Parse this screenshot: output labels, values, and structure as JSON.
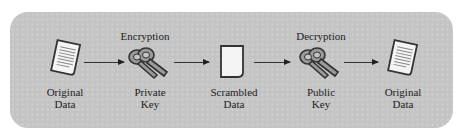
{
  "diagram": {
    "steps": [
      {
        "id": "original-data-1",
        "label_line1": "Original",
        "label_line2": "Data",
        "icon": "document-icon"
      },
      {
        "id": "private-key",
        "title": "Encryption",
        "label_line1": "Private",
        "label_line2": "Key",
        "icon": "keys-icon"
      },
      {
        "id": "scrambled-data",
        "label_line1": "Scrambled",
        "label_line2": "Data",
        "icon": "blank-document-icon"
      },
      {
        "id": "public-key",
        "title": "Decryption",
        "label_line1": "Public",
        "label_line2": "Key",
        "icon": "keys-icon"
      },
      {
        "id": "original-data-2",
        "label_line1": "Original",
        "label_line2": "Data",
        "icon": "document-icon"
      }
    ],
    "arrows": [
      {
        "from": "original-data-1",
        "to": "private-key"
      },
      {
        "from": "private-key",
        "to": "scrambled-data"
      },
      {
        "from": "scrambled-data",
        "to": "public-key"
      },
      {
        "from": "public-key",
        "to": "original-data-2"
      }
    ],
    "colors": {
      "panel": "#c4c4c4",
      "stroke": "#333333",
      "paper": "#f4f4f4",
      "key": "#8a8a8a"
    }
  }
}
